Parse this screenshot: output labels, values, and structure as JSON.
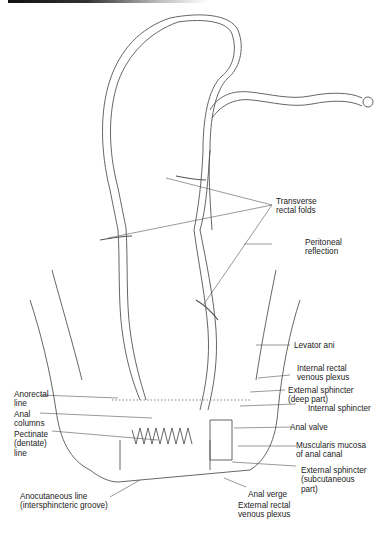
{
  "figure": {
    "type": "anatomical illustration"
  },
  "labels": {
    "transverse_rectal_folds": "Transverse\nrectal folds",
    "peritoneal_reflection": "Peritoneal\nreflection",
    "levator_ani": "Levator ani",
    "internal_rectal_venous_plexus": "Internal rectal\nvenous plexus",
    "external_sphincter_deep": "External sphincter\n(deep part)",
    "internal_sphincter": "Internal sphincter",
    "anal_valve": "Anal valve",
    "muscularis_mucosa": "Muscularis mucosa\nof anal canal",
    "external_sphincter_subcutaneous": "External sphincter\n(subcutaneous\npart)",
    "anal_verge": "Anal verge",
    "external_rectal_venous_plexus": "External rectal\nvenous plexus",
    "anorectal_line": "Anorectal\nline",
    "anal_columns": "Anal\ncolumns",
    "pectinate_line": "Pectinate\n(dentate)\nline",
    "anocutaneous_line": "Anocutaneous line\n(intersphincteric groove)"
  },
  "colors": {
    "ink": "#222222",
    "line": "#555555",
    "shade": "#9a9a9a",
    "background": "#ffffff"
  }
}
